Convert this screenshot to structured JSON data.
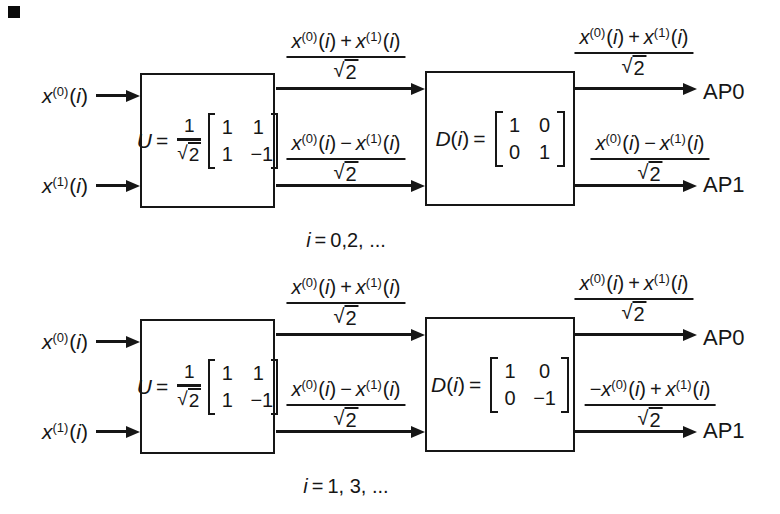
{
  "colors": {
    "ink": "#161616",
    "bg": "#ffffff"
  },
  "diagrams": [
    {
      "caption": [
        {
          "k": "v",
          "t": "i"
        },
        {
          "k": "o",
          "t": "="
        },
        {
          "k": "p",
          "t": "0,2, ..."
        }
      ],
      "inputs": [
        [
          {
            "k": "v",
            "t": "x"
          },
          {
            "k": "s",
            "t": "(0)"
          },
          {
            "k": "p",
            "t": "("
          },
          {
            "k": "v",
            "t": "i"
          },
          {
            "k": "p",
            "t": ")"
          }
        ],
        [
          {
            "k": "v",
            "t": "x"
          },
          {
            "k": "s",
            "t": "(1)"
          },
          {
            "k": "p",
            "t": "("
          },
          {
            "k": "v",
            "t": "i"
          },
          {
            "k": "p",
            "t": ")"
          }
        ]
      ],
      "u_block": {
        "label": [
          {
            "k": "v",
            "t": "U"
          },
          {
            "k": "o",
            "t": "="
          }
        ],
        "coef": {
          "num": "1",
          "den": {
            "rad": "√",
            "v": "2"
          }
        },
        "matrix": [
          [
            "1",
            "1"
          ],
          [
            "1",
            "−1"
          ]
        ]
      },
      "d_block": {
        "label": [
          {
            "k": "v",
            "t": "D"
          },
          {
            "k": "p",
            "t": "("
          },
          {
            "k": "v",
            "t": "i"
          },
          {
            "k": "p",
            "t": ")"
          },
          {
            "k": "o",
            "t": "="
          }
        ],
        "matrix": [
          [
            "1",
            "0"
          ],
          [
            "0",
            "1"
          ]
        ]
      },
      "fractions": {
        "mid_top": {
          "num": [
            {
              "k": "v",
              "t": "x"
            },
            {
              "k": "s",
              "t": "(0)"
            },
            {
              "k": "p",
              "t": "("
            },
            {
              "k": "v",
              "t": "i"
            },
            {
              "k": "p",
              "t": ")"
            },
            {
              "k": "o",
              "t": "+"
            },
            {
              "k": "v",
              "t": "x"
            },
            {
              "k": "s",
              "t": "(1)"
            },
            {
              "k": "p",
              "t": "("
            },
            {
              "k": "v",
              "t": "i"
            },
            {
              "k": "p",
              "t": ")"
            }
          ],
          "den": {
            "rad": "√",
            "v": "2"
          }
        },
        "mid_bottom": {
          "num": [
            {
              "k": "v",
              "t": "x"
            },
            {
              "k": "s",
              "t": "(0)"
            },
            {
              "k": "p",
              "t": "("
            },
            {
              "k": "v",
              "t": "i"
            },
            {
              "k": "p",
              "t": ")"
            },
            {
              "k": "o",
              "t": "−"
            },
            {
              "k": "v",
              "t": "x"
            },
            {
              "k": "s",
              "t": "(1)"
            },
            {
              "k": "p",
              "t": "("
            },
            {
              "k": "v",
              "t": "i"
            },
            {
              "k": "p",
              "t": ")"
            }
          ],
          "den": {
            "rad": "√",
            "v": "2"
          }
        },
        "out_top": {
          "num": [
            {
              "k": "v",
              "t": "x"
            },
            {
              "k": "s",
              "t": "(0)"
            },
            {
              "k": "p",
              "t": "("
            },
            {
              "k": "v",
              "t": "i"
            },
            {
              "k": "p",
              "t": ")"
            },
            {
              "k": "o",
              "t": "+"
            },
            {
              "k": "v",
              "t": "x"
            },
            {
              "k": "s",
              "t": "(1)"
            },
            {
              "k": "p",
              "t": "("
            },
            {
              "k": "v",
              "t": "i"
            },
            {
              "k": "p",
              "t": ")"
            }
          ],
          "den": {
            "rad": "√",
            "v": "2"
          }
        },
        "out_bottom": {
          "num": [
            {
              "k": "v",
              "t": "x"
            },
            {
              "k": "s",
              "t": "(0)"
            },
            {
              "k": "p",
              "t": "("
            },
            {
              "k": "v",
              "t": "i"
            },
            {
              "k": "p",
              "t": ")"
            },
            {
              "k": "o",
              "t": "−"
            },
            {
              "k": "v",
              "t": "x"
            },
            {
              "k": "s",
              "t": "(1)"
            },
            {
              "k": "p",
              "t": "("
            },
            {
              "k": "v",
              "t": "i"
            },
            {
              "k": "p",
              "t": ")"
            }
          ],
          "den": {
            "rad": "√",
            "v": "2"
          }
        }
      },
      "outputs": [
        "AP0",
        "AP1"
      ]
    },
    {
      "caption": [
        {
          "k": "v",
          "t": "i"
        },
        {
          "k": "o",
          "t": "="
        },
        {
          "k": "p",
          "t": "1, 3, ..."
        }
      ],
      "inputs": [
        [
          {
            "k": "v",
            "t": "x"
          },
          {
            "k": "s",
            "t": "(0)"
          },
          {
            "k": "p",
            "t": "("
          },
          {
            "k": "v",
            "t": "i"
          },
          {
            "k": "p",
            "t": ")"
          }
        ],
        [
          {
            "k": "v",
            "t": "x"
          },
          {
            "k": "s",
            "t": "(1)"
          },
          {
            "k": "p",
            "t": "("
          },
          {
            "k": "v",
            "t": "i"
          },
          {
            "k": "p",
            "t": ")"
          }
        ]
      ],
      "u_block": {
        "label": [
          {
            "k": "v",
            "t": "U"
          },
          {
            "k": "o",
            "t": "="
          }
        ],
        "coef": {
          "num": "1",
          "den": {
            "rad": "√",
            "v": "2"
          }
        },
        "matrix": [
          [
            "1",
            "1"
          ],
          [
            "1",
            "−1"
          ]
        ]
      },
      "d_block": {
        "label": [
          {
            "k": "v",
            "t": "D"
          },
          {
            "k": "p",
            "t": "("
          },
          {
            "k": "v",
            "t": "i"
          },
          {
            "k": "p",
            "t": ")"
          },
          {
            "k": "o",
            "t": "="
          }
        ],
        "matrix": [
          [
            "1",
            "0"
          ],
          [
            "0",
            "−1"
          ]
        ]
      },
      "fractions": {
        "mid_top": {
          "num": [
            {
              "k": "v",
              "t": "x"
            },
            {
              "k": "s",
              "t": "(0)"
            },
            {
              "k": "p",
              "t": "("
            },
            {
              "k": "v",
              "t": "i"
            },
            {
              "k": "p",
              "t": ")"
            },
            {
              "k": "o",
              "t": "+"
            },
            {
              "k": "v",
              "t": "x"
            },
            {
              "k": "s",
              "t": "(1)"
            },
            {
              "k": "p",
              "t": "("
            },
            {
              "k": "v",
              "t": "i"
            },
            {
              "k": "p",
              "t": ")"
            }
          ],
          "den": {
            "rad": "√",
            "v": "2"
          }
        },
        "mid_bottom": {
          "num": [
            {
              "k": "v",
              "t": "x"
            },
            {
              "k": "s",
              "t": "(0)"
            },
            {
              "k": "p",
              "t": "("
            },
            {
              "k": "v",
              "t": "i"
            },
            {
              "k": "p",
              "t": ")"
            },
            {
              "k": "o",
              "t": "−"
            },
            {
              "k": "v",
              "t": "x"
            },
            {
              "k": "s",
              "t": "(1)"
            },
            {
              "k": "p",
              "t": "("
            },
            {
              "k": "v",
              "t": "i"
            },
            {
              "k": "p",
              "t": ")"
            }
          ],
          "den": {
            "rad": "√",
            "v": "2"
          }
        },
        "out_top": {
          "num": [
            {
              "k": "v",
              "t": "x"
            },
            {
              "k": "s",
              "t": "(0)"
            },
            {
              "k": "p",
              "t": "("
            },
            {
              "k": "v",
              "t": "i"
            },
            {
              "k": "p",
              "t": ")"
            },
            {
              "k": "o",
              "t": "+"
            },
            {
              "k": "v",
              "t": "x"
            },
            {
              "k": "s",
              "t": "(1)"
            },
            {
              "k": "p",
              "t": "("
            },
            {
              "k": "v",
              "t": "i"
            },
            {
              "k": "p",
              "t": ")"
            }
          ],
          "den": {
            "rad": "√",
            "v": "2"
          }
        },
        "out_bottom": {
          "num": [
            {
              "k": "p",
              "t": "−"
            },
            {
              "k": "v",
              "t": "x"
            },
            {
              "k": "s",
              "t": "(0)"
            },
            {
              "k": "p",
              "t": "("
            },
            {
              "k": "v",
              "t": "i"
            },
            {
              "k": "p",
              "t": ")"
            },
            {
              "k": "o",
              "t": "+"
            },
            {
              "k": "v",
              "t": "x"
            },
            {
              "k": "s",
              "t": "(1)"
            },
            {
              "k": "p",
              "t": "("
            },
            {
              "k": "v",
              "t": "i"
            },
            {
              "k": "p",
              "t": ")"
            }
          ],
          "den": {
            "rad": "√",
            "v": "2"
          }
        }
      },
      "outputs": [
        "AP0",
        "AP1"
      ]
    }
  ]
}
